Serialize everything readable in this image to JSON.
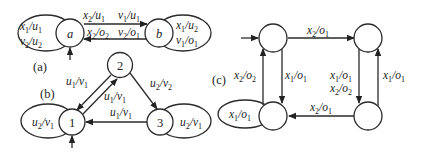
{
  "figure": {
    "panels": [
      {
        "id": "a",
        "tag": "(a)",
        "states": [
          {
            "name": "a",
            "label": "a",
            "initial": true
          },
          {
            "name": "b",
            "label": "b",
            "initial": false
          }
        ],
        "transitions": [
          {
            "from": "a",
            "to": "a",
            "labels": [
              [
                "x",
                "1",
                "u",
                "1"
              ],
              [
                "v",
                "2",
                "u",
                "2"
              ]
            ]
          },
          {
            "from": "a",
            "to": "b",
            "labels": [
              [
                "x",
                "2",
                "u",
                "1"
              ],
              [
                "v",
                "1",
                "u",
                "1"
              ]
            ]
          },
          {
            "from": "b",
            "to": "a",
            "labels": [
              [
                "x",
                "2",
                "o",
                "2"
              ],
              [
                "v",
                "2",
                "o",
                "1"
              ]
            ]
          },
          {
            "from": "b",
            "to": "b",
            "labels": [
              [
                "x",
                "1",
                "u",
                "2"
              ],
              [
                "v",
                "1",
                "o",
                "1"
              ]
            ]
          }
        ]
      },
      {
        "id": "b",
        "tag": "(b)",
        "states": [
          {
            "name": "1",
            "label": "1",
            "initial": true
          },
          {
            "name": "2",
            "label": "2",
            "initial": false
          },
          {
            "name": "3",
            "label": "3",
            "initial": false
          }
        ],
        "transitions": [
          {
            "from": "1",
            "to": "1",
            "labels": [
              [
                "u",
                "2",
                "v",
                "1"
              ]
            ]
          },
          {
            "from": "2",
            "to": "1",
            "labels": [
              [
                "u",
                "1",
                "v",
                "1"
              ]
            ]
          },
          {
            "from": "1",
            "to": "2",
            "labels": [
              [
                "u",
                "1",
                "v",
                "1"
              ]
            ]
          },
          {
            "from": "2",
            "to": "3",
            "labels": [
              [
                "u",
                "2",
                "v",
                "2"
              ]
            ]
          },
          {
            "from": "3",
            "to": "1",
            "labels": [
              [
                "u",
                "1",
                "v",
                "1"
              ]
            ]
          },
          {
            "from": "3",
            "to": "3",
            "labels": [
              [
                "u",
                "2",
                "v",
                "1"
              ]
            ]
          }
        ]
      },
      {
        "id": "c",
        "tag": "(c)",
        "states": [
          {
            "name": "top-left",
            "label": "",
            "initial": true
          },
          {
            "name": "top-right",
            "label": "",
            "initial": false
          },
          {
            "name": "bottom-right",
            "label": "",
            "initial": false
          },
          {
            "name": "bottom-left",
            "label": "",
            "initial": false
          }
        ],
        "transitions": [
          {
            "from": "top-left",
            "to": "top-right",
            "labels": [
              [
                "x",
                "2",
                "o",
                "1"
              ]
            ]
          },
          {
            "from": "top-right",
            "to": "bottom-right",
            "labels": [
              [
                "x",
                "1",
                "o",
                "1"
              ],
              [
                "x",
                "2",
                "o",
                "2"
              ]
            ]
          },
          {
            "from": "bottom-right",
            "to": "top-right",
            "labels": [
              [
                "x",
                "1",
                "o",
                "1"
              ]
            ]
          },
          {
            "from": "bottom-right",
            "to": "bottom-left",
            "labels": [
              [
                "x",
                "2",
                "o",
                "1"
              ]
            ]
          },
          {
            "from": "top-left",
            "to": "bottom-left",
            "labels": [
              [
                "x",
                "1",
                "o",
                "1"
              ]
            ]
          },
          {
            "from": "bottom-left",
            "to": "top-left",
            "labels": [
              [
                "x",
                "2",
                "o",
                "2"
              ]
            ]
          },
          {
            "from": "bottom-left",
            "to": "bottom-left",
            "labels": [
              [
                "x",
                "1",
                "o",
                "1"
              ]
            ]
          }
        ]
      }
    ]
  }
}
